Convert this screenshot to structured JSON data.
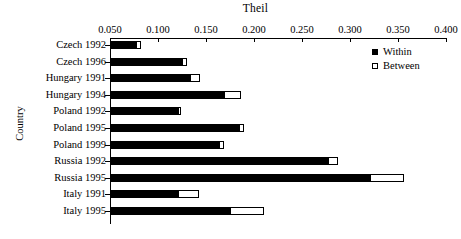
{
  "chart_data": {
    "type": "bar",
    "orientation": "horizontal",
    "title": "Theil",
    "xlabel": "Theil",
    "ylabel": "Country",
    "xlim": [
      0.05,
      0.4
    ],
    "xticks": [
      "0.050",
      "0.100",
      "0.150",
      "0.200",
      "0.250",
      "0.300",
      "0.350",
      "0.400"
    ],
    "xtick_values": [
      0.05,
      0.1,
      0.15,
      0.2,
      0.25,
      0.3,
      0.35,
      0.4
    ],
    "grid": false,
    "legend_position": "top-right",
    "stacked": true,
    "categories": [
      "Czech 1992",
      "Czech 1996",
      "Hungary 1991",
      "Hungary 1994",
      "Poland 1992",
      "Poland 1995",
      "Poland 1999",
      "Russia 1992",
      "Russia 1995",
      "Italy 1991",
      "Italy 1995"
    ],
    "series": [
      {
        "name": "Within",
        "color": "#000000",
        "values": [
          0.076,
          0.124,
          0.132,
          0.168,
          0.12,
          0.183,
          0.163,
          0.276,
          0.32,
          0.12,
          0.174
        ]
      },
      {
        "name": "Between",
        "color": "#ffffff",
        "values": [
          0.005,
          0.005,
          0.011,
          0.017,
          0.003,
          0.006,
          0.005,
          0.01,
          0.035,
          0.022,
          0.035
        ]
      }
    ],
    "totals": [
      0.081,
      0.129,
      0.143,
      0.185,
      0.123,
      0.189,
      0.168,
      0.286,
      0.355,
      0.142,
      0.209
    ]
  },
  "legend": {
    "items": [
      {
        "label": "Within",
        "swatch": "filled-square-icon"
      },
      {
        "label": "Between",
        "swatch": "open-square-icon"
      }
    ]
  }
}
